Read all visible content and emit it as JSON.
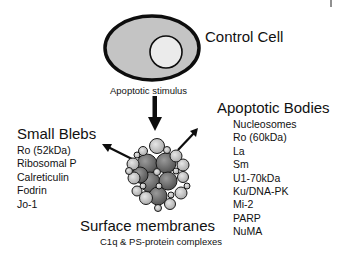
{
  "diagram": {
    "control_cell": {
      "label": "Control Cell",
      "cytoplasm_color": "#c4c4c4",
      "nucleus_color": "#ebebeb",
      "outline_color": "#0d0d0d"
    },
    "stimulus": {
      "label": "Apoptotic stimulus"
    },
    "small_blebs": {
      "title": "Small Blebs",
      "items": [
        "Ro (52kDa)",
        "Ribosomal P",
        "Calreticulin",
        "Fodrin",
        "Jo-1"
      ]
    },
    "apoptotic_bodies": {
      "title": "Apoptotic Bodies",
      "items": [
        "Nucleosomes",
        "Ro (60kDa)",
        "La",
        "Sm",
        "U1-70kDa",
        "Ku/DNA-PK",
        "Mi-2",
        "PARP",
        "NuMA"
      ]
    },
    "surface_membranes": {
      "title": "Surface membranes",
      "subtitle": "C1q & PS-protein complexes"
    },
    "colors": {
      "arrow": "#0d0d0d",
      "bleb_light": "#d2d2d2",
      "bleb_dark": "#6e6e6e"
    }
  }
}
